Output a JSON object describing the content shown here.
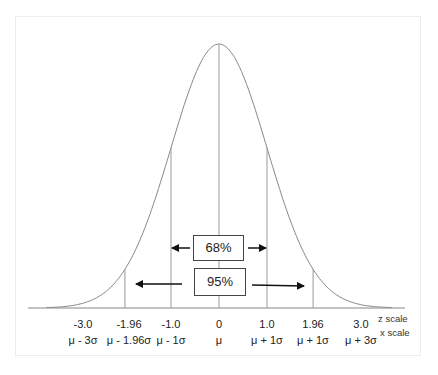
{
  "curve": {
    "type": "normal",
    "mean": 0,
    "sd": 1,
    "x_range_z": [
      -3.6,
      3.6
    ]
  },
  "vertical_lines_z": [
    -1.96,
    -1.0,
    0,
    1.0,
    1.96
  ],
  "ticks": [
    {
      "z": -3.0,
      "z_label": "-3.0",
      "x_label": "μ - 3σ"
    },
    {
      "z": -1.96,
      "z_label": "-1.96",
      "x_label": "μ - 1.96σ"
    },
    {
      "z": -1.0,
      "z_label": "-1.0",
      "x_label": "μ - 1σ"
    },
    {
      "z": 0,
      "z_label": "0",
      "x_label": "μ"
    },
    {
      "z": 1.0,
      "z_label": "1.0",
      "x_label": "μ + 1σ"
    },
    {
      "z": 1.96,
      "z_label": "1.96",
      "x_label": "μ + 1σ"
    },
    {
      "z": 3.0,
      "z_label": "3.0",
      "x_label": "μ + 3σ"
    }
  ],
  "scale_labels": {
    "z": "z scale",
    "x": "x scale"
  },
  "intervals": [
    {
      "label": "68%",
      "from_z": -1.0,
      "to_z": 1.0
    },
    {
      "label": "95%",
      "from_z": -1.96,
      "to_z": 1.96
    }
  ]
}
